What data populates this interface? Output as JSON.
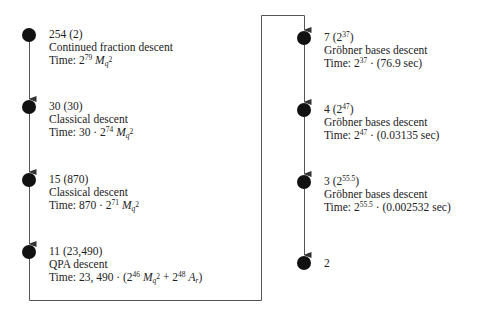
{
  "diagram": {
    "type": "descent-chain",
    "colors": {
      "node": "#111111",
      "edge": "#555555",
      "text": "#222222"
    },
    "steps": [
      {
        "id": "n254",
        "degree": "254",
        "count": "2",
        "method": "Continued fraction descent",
        "time_prefix": "Time: ",
        "time_base": "2",
        "time_exp": "79",
        "time_suffix_var": "M",
        "time_suffix_sub": "q",
        "time_suffix_subsup": "2",
        "time_tail": ""
      },
      {
        "id": "n30",
        "degree": "30",
        "count": "30",
        "method": "Classical descent",
        "time_prefix": "Time: 30 · ",
        "time_base": "2",
        "time_exp": "74",
        "time_suffix_var": "M",
        "time_suffix_sub": "q",
        "time_suffix_subsup": "2",
        "time_tail": ""
      },
      {
        "id": "n15",
        "degree": "15",
        "count": "870",
        "method": "Classical descent",
        "time_prefix": "Time: 870 · ",
        "time_base": "2",
        "time_exp": "71",
        "time_suffix_var": "M",
        "time_suffix_sub": "q",
        "time_suffix_subsup": "2",
        "time_tail": ""
      },
      {
        "id": "n11",
        "degree": "11",
        "count": "23,490",
        "method": "QPA descent",
        "time_prefix": "Time: 23, 490 · (",
        "time_base": "2",
        "time_exp": "46",
        "time_suffix_var": "M",
        "time_suffix_sub": "q",
        "time_suffix_subsup": "2",
        "time_plus": " + ",
        "time_base2": "2",
        "time_exp2": "48",
        "time_var2": "A",
        "time_sub2": "r",
        "time_tail": ")"
      },
      {
        "id": "n7",
        "degree": "7",
        "count_base": "2",
        "count_exp": "37",
        "method": "Gröbner bases descent",
        "time_prefix": "Time: ",
        "time_base": "2",
        "time_exp": "37",
        "time_tail": " · (76.9 sec)"
      },
      {
        "id": "n4",
        "degree": "4",
        "count_base": "2",
        "count_exp": "47",
        "method": "Gröbner bases descent",
        "time_prefix": "Time: ",
        "time_base": "2",
        "time_exp": "47",
        "time_tail": " · (0.03135 sec)"
      },
      {
        "id": "n3",
        "degree": "3",
        "count_base": "2",
        "count_exp": "55.5",
        "method": "Gröbner bases descent",
        "time_prefix": "Time: ",
        "time_base": "2",
        "time_exp": "55.5",
        "time_tail": " · (0.002532 sec)"
      },
      {
        "id": "n2",
        "degree": "2"
      }
    ]
  }
}
